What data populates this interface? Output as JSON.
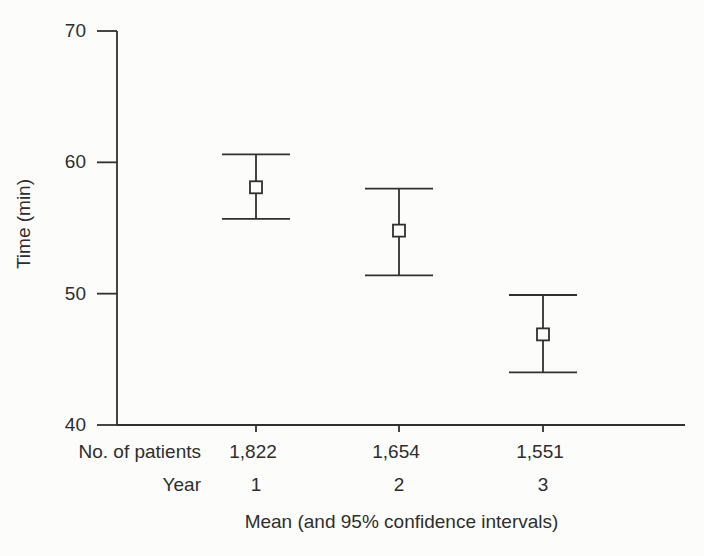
{
  "colors": {
    "background": "#fcfcfb",
    "ink": "#2e2e2e",
    "line": "#303030"
  },
  "chart_data": {
    "type": "errorbar",
    "title": "",
    "caption": "Mean (and 95% confidence intervals)",
    "ylabel": "Time (min)",
    "xlabel": "",
    "ylim": [
      40,
      70
    ],
    "yticks": [
      40,
      50,
      60,
      70
    ],
    "grid": false,
    "legend": null,
    "marker": "open-square",
    "rows": {
      "patients_label": "No. of patients",
      "year_label": "Year"
    },
    "points": [
      {
        "year": "1",
        "patients": "1,822",
        "mean": 58.1,
        "ci_low": 55.7,
        "ci_high": 60.6
      },
      {
        "year": "2",
        "patients": "1,654",
        "mean": 54.8,
        "ci_low": 51.4,
        "ci_high": 58.0
      },
      {
        "year": "3",
        "patients": "1,551",
        "mean": 46.9,
        "ci_low": 44.0,
        "ci_high": 49.9
      }
    ]
  }
}
